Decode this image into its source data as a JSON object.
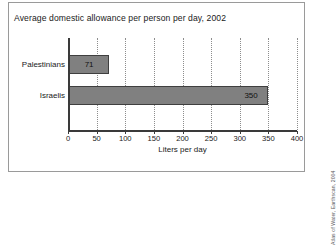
{
  "figure": {
    "title": "Average domestic allowance per person per day, 2002",
    "source_credit": "Atlas of Water, Earthscan, 2004",
    "frame_color": "#9a9a9a",
    "background_color": "#ffffff"
  },
  "chart_data": {
    "type": "bar",
    "orientation": "horizontal",
    "title": "Average domestic allowance per person per day, 2002",
    "subtitle": "",
    "categories": [
      "Palestinians",
      "Israelis"
    ],
    "values": [
      71,
      350
    ],
    "data_labels": [
      "71",
      "350"
    ],
    "xlabel": "Liters per day",
    "ylabel": "",
    "xlim": [
      0,
      400
    ],
    "xticks": [
      0,
      50,
      100,
      150,
      200,
      250,
      300,
      350,
      400
    ],
    "xtick_labels": [
      "0",
      "50",
      "100",
      "150",
      "200",
      "250",
      "300",
      "350",
      "400"
    ],
    "grid": true,
    "grid_axis": "x",
    "grid_style": "dotted",
    "legend": false,
    "legend_position": "none",
    "bar_color": "#808080",
    "bar_edge_color": "#3f3f3f",
    "axis_color": "#3a3a3a",
    "gridline_color": "#8d8d8d",
    "annotations": [
      "Atlas of Water, Earthscan, 2004"
    ]
  }
}
